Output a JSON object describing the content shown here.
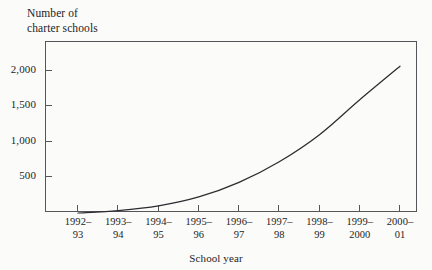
{
  "chart_data": {
    "type": "line",
    "title": "",
    "ylabel": "Number of\ncharter schools",
    "xlabel": "School year",
    "categories": [
      "1992–\n93",
      "1993–\n94",
      "1994–\n95",
      "1995–\n96",
      "1996–\n97",
      "1997–\n98",
      "1998–\n99",
      "1999–\n2000",
      "2000–\n01"
    ],
    "values": [
      0,
      35,
      100,
      225,
      430,
      720,
      1100,
      1590,
      2060
    ],
    "ylim": [
      0,
      2400
    ],
    "yticks": [
      500,
      1000,
      1500,
      2000
    ],
    "ytick_labels": [
      "500",
      "1,000",
      "1,500",
      "2,000"
    ],
    "grid": false,
    "legend": false,
    "series_color": "#2b2b30",
    "frame_color": "#55555a",
    "background_color": "#fbfbfa"
  }
}
